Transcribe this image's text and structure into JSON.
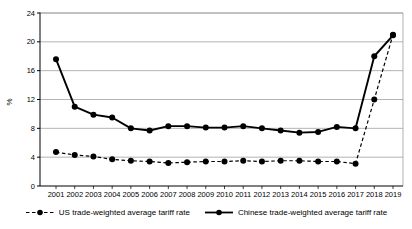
{
  "chart_data": {
    "type": "line",
    "title": "",
    "xlabel": "",
    "ylabel": "%",
    "ylim": [
      0,
      24
    ],
    "yticks": [
      0,
      4,
      8,
      12,
      16,
      20,
      24
    ],
    "grid": "horizontal",
    "legend_position": "bottom",
    "categories": [
      "2001",
      "2002",
      "2003",
      "2004",
      "2005",
      "2006",
      "2007",
      "2008",
      "2009",
      "2010",
      "2011",
      "2012",
      "2013",
      "2014",
      "2015",
      "2016",
      "2017",
      "2018",
      "2019"
    ],
    "series": [
      {
        "name": "US trade-weighted average tariff rate",
        "style": "dashed",
        "marker": "circle",
        "color": "#000000",
        "values": [
          4.7,
          4.3,
          4.1,
          3.7,
          3.5,
          3.4,
          3.2,
          3.3,
          3.4,
          3.4,
          3.5,
          3.4,
          3.5,
          3.5,
          3.4,
          3.4,
          3.1,
          12.0,
          21.0
        ]
      },
      {
        "name": "Chinese trade-weighted average tariff rate",
        "style": "solid",
        "marker": "circle",
        "color": "#000000",
        "values": [
          17.6,
          11.0,
          9.9,
          9.5,
          8.0,
          7.7,
          8.3,
          8.3,
          8.1,
          8.1,
          8.3,
          8.0,
          7.7,
          7.4,
          7.5,
          8.2,
          8.0,
          18.0,
          20.9
        ]
      }
    ]
  },
  "colors": {
    "background": "#ffffff",
    "line": "#000000",
    "grid": "#999999",
    "axis": "#000000",
    "text": "#000000"
  }
}
